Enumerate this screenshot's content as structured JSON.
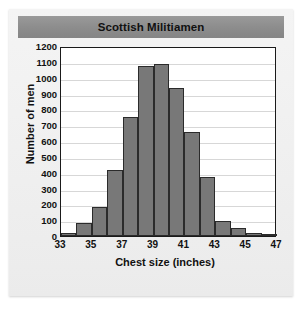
{
  "figure": {
    "title": "Scottish Militiamen",
    "background_color": "#f0f0f0",
    "title_banner_color": "#8d8d8d"
  },
  "chart_data": {
    "type": "bar",
    "title": "Scottish Militiamen",
    "xlabel": "Chest size (inches)",
    "ylabel": "Number of men",
    "categories": [
      33,
      34,
      35,
      36,
      37,
      38,
      39,
      40,
      41,
      42,
      43,
      44,
      45,
      46
    ],
    "values": [
      20,
      80,
      185,
      420,
      750,
      1075,
      1085,
      935,
      660,
      370,
      95,
      50,
      20,
      5
    ],
    "xlim": [
      33,
      47
    ],
    "ylim": [
      0,
      1200
    ],
    "x_ticks": [
      33,
      35,
      37,
      39,
      41,
      43,
      45,
      47
    ],
    "y_ticks": [
      0,
      100,
      200,
      300,
      400,
      500,
      600,
      700,
      800,
      900,
      1000,
      1100,
      1200
    ],
    "grid": true,
    "legend": null,
    "bar_color": "#787878",
    "bar_edge_color": "#2b2b2b",
    "bin_width": 1
  }
}
